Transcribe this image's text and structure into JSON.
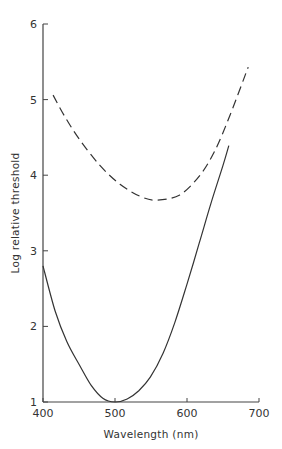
{
  "chart_data": {
    "type": "line",
    "title": "",
    "xlabel": "Wavelength (nm)",
    "ylabel": "Log relative threshold",
    "xlim": [
      400,
      700
    ],
    "ylim": [
      1,
      6
    ],
    "x_ticks": [
      400,
      500,
      600,
      700
    ],
    "y_ticks": [
      1,
      2,
      3,
      4,
      5,
      6
    ],
    "grid": false,
    "legend": null,
    "series": [
      {
        "name": "dashed curve",
        "style": "dashed",
        "color": "#333333",
        "x": [
          414,
          430,
          451,
          479,
          507,
          535,
          558,
          590,
          618,
          639,
          660,
          685
        ],
        "y": [
          5.06,
          4.78,
          4.47,
          4.13,
          3.88,
          3.72,
          3.67,
          3.74,
          4.0,
          4.33,
          4.8,
          5.43
        ]
      },
      {
        "name": "solid curve",
        "style": "solid",
        "color": "#333333",
        "x": [
          400,
          417,
          433,
          450,
          467,
          483,
          500,
          517,
          533,
          549,
          567,
          583,
          600,
          617,
          633,
          650,
          658
        ],
        "y": [
          2.8,
          2.2,
          1.8,
          1.5,
          1.22,
          1.05,
          1.0,
          1.04,
          1.15,
          1.33,
          1.65,
          2.05,
          2.56,
          3.1,
          3.62,
          4.13,
          4.39
        ]
      }
    ]
  }
}
